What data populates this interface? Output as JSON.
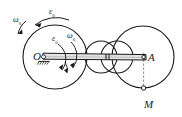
{
  "figure": {
    "background_color": "#ffffff",
    "stroke_color": "#1a1a1a",
    "rod_fill": "#d8d8d8",
    "labels": {
      "pivot_O": "O",
      "point_A": "A",
      "point_M": "M",
      "omega_outer_sym": "ω",
      "omega_outer_sub": "0",
      "epsilon_outer_sym": "ε",
      "epsilon_outer_sub": "0",
      "epsilon_inner_sym": "ε",
      "epsilon_inner_sub": "0",
      "omega_inner_sym": "ω",
      "omega_inner_sub": "0"
    },
    "geometry": {
      "left_wheel": {
        "cx": 55,
        "cy": 57,
        "r": 32
      },
      "mid_circle_left": {
        "cx": 100,
        "cy": 57,
        "r": 16
      },
      "mid_circle_right": {
        "cx": 117,
        "cy": 57,
        "r": 16
      },
      "right_wheel": {
        "cx": 143,
        "cy": 57,
        "r": 31
      },
      "rod": {
        "x1": 42,
        "y1": 54,
        "x2": 146,
        "y2": 60
      },
      "point_A": {
        "x": 143,
        "y": 57
      },
      "point_M": {
        "x": 143,
        "y": 88
      }
    }
  }
}
